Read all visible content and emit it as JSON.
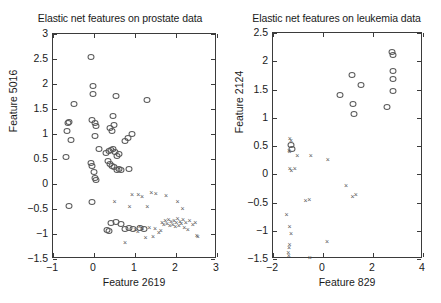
{
  "figure": {
    "background": "#ffffff",
    "marker_color": "#5a5a5a",
    "axis_color": "#3b3b3b"
  },
  "chart_data": [
    {
      "type": "scatter",
      "title": "Elastic net features on prostate data",
      "xlabel": "Feature 2619",
      "ylabel": "Feature 5016",
      "xlim": [
        -1,
        3
      ],
      "ylim": [
        -1.5,
        3
      ],
      "xticks": [
        -1,
        0,
        1,
        2,
        3
      ],
      "xticklabels": [
        "-1",
        "0",
        "1",
        "2",
        "3"
      ],
      "yticks": [
        -1.5,
        -1,
        -0.5,
        0,
        0.5,
        1,
        1.5,
        2,
        2.5,
        3
      ],
      "yticklabels": [
        "-1.5",
        "-1",
        "-0.5",
        "0",
        "0.5",
        "1",
        "1.5",
        "2",
        "2.5",
        "3"
      ],
      "grid": false,
      "legend": "none",
      "series": [
        {
          "name": "class-circle",
          "marker": "circle",
          "points": [
            [
              -0.08,
              2.55
            ],
            [
              -0.02,
              1.97
            ],
            [
              -0.03,
              1.81
            ],
            [
              -0.49,
              1.61
            ],
            [
              0.53,
              1.77
            ],
            [
              1.29,
              1.68
            ],
            [
              -0.64,
              1.22
            ],
            [
              -0.6,
              1.25
            ],
            [
              -0.66,
              1.06
            ],
            [
              -0.57,
              0.89
            ],
            [
              -0.06,
              1.29
            ],
            [
              0.02,
              1.22
            ],
            [
              0.06,
              1.17
            ],
            [
              0.46,
              1.36
            ],
            [
              0.4,
              1.13
            ],
            [
              0.44,
              1.06
            ],
            [
              0.49,
              1.18
            ],
            [
              0.93,
              1.01
            ],
            [
              -0.68,
              0.54
            ],
            [
              0.03,
              0.96
            ],
            [
              0.13,
              0.7
            ],
            [
              0.3,
              0.62
            ],
            [
              0.36,
              0.66
            ],
            [
              0.42,
              0.68
            ],
            [
              0.46,
              0.7
            ],
            [
              0.52,
              0.64
            ],
            [
              0.56,
              0.56
            ],
            [
              0.6,
              0.61
            ],
            [
              0.76,
              0.86
            ],
            [
              0.84,
              0.92
            ],
            [
              0.33,
              0.46
            ],
            [
              0.38,
              0.4
            ],
            [
              0.44,
              0.37
            ],
            [
              0.49,
              0.34
            ],
            [
              0.57,
              0.29
            ],
            [
              0.62,
              0.3
            ],
            [
              0.66,
              0.28
            ],
            [
              0.85,
              0.31
            ],
            [
              -0.07,
              0.43
            ],
            [
              -0.04,
              0.37
            ],
            [
              -0.01,
              0.24
            ],
            [
              0.02,
              0.13
            ],
            [
              0.04,
              0.09
            ],
            [
              -0.6,
              -0.44
            ],
            [
              -0.04,
              -0.35
            ],
            [
              0.31,
              -0.92
            ],
            [
              0.36,
              -0.93
            ],
            [
              0.41,
              -0.77
            ],
            [
              0.53,
              -0.76
            ],
            [
              0.65,
              -0.8
            ],
            [
              0.75,
              -0.9
            ],
            [
              0.86,
              -0.87
            ],
            [
              0.94,
              -0.89
            ],
            [
              1.13,
              -0.88
            ],
            [
              1.22,
              -0.9
            ]
          ]
        },
        {
          "name": "class-cross",
          "marker": "cross",
          "points": [
            [
              0.93,
              -0.22
            ],
            [
              1.08,
              -0.22
            ],
            [
              1.17,
              -0.25
            ],
            [
              1.4,
              -0.18
            ],
            [
              1.51,
              -0.19
            ],
            [
              1.76,
              -0.23
            ],
            [
              0.5,
              -0.35
            ],
            [
              0.87,
              -0.46
            ],
            [
              1.3,
              -0.45
            ],
            [
              2.04,
              -0.36
            ],
            [
              2.16,
              -0.5
            ],
            [
              0.76,
              -1.17
            ],
            [
              1.01,
              -0.91
            ],
            [
              1.07,
              -0.96
            ],
            [
              1.12,
              -0.86
            ],
            [
              1.18,
              -0.9
            ],
            [
              1.26,
              -1.07
            ],
            [
              1.35,
              -0.87
            ],
            [
              1.44,
              -1.06
            ],
            [
              1.49,
              -0.89
            ],
            [
              1.66,
              -0.78
            ],
            [
              1.7,
              -0.82
            ],
            [
              1.74,
              -0.74
            ],
            [
              1.78,
              -0.79
            ],
            [
              1.82,
              -0.71
            ],
            [
              1.85,
              -0.84
            ],
            [
              1.88,
              -0.76
            ],
            [
              1.92,
              -0.81
            ],
            [
              1.95,
              -0.73
            ],
            [
              1.98,
              -0.86
            ],
            [
              2.01,
              -0.78
            ],
            [
              2.04,
              -0.7
            ],
            [
              2.07,
              -0.83
            ],
            [
              2.1,
              -0.75
            ],
            [
              2.13,
              -0.8
            ],
            [
              2.17,
              -0.72
            ],
            [
              2.2,
              -0.88
            ],
            [
              2.24,
              -0.78
            ],
            [
              2.29,
              -0.92
            ],
            [
              2.33,
              -0.74
            ],
            [
              2.41,
              -0.81
            ],
            [
              2.47,
              -0.77
            ],
            [
              2.51,
              -1.04
            ],
            [
              2.53,
              -1.06
            ],
            [
              1.58,
              -0.97
            ],
            [
              1.63,
              -0.93
            ]
          ]
        }
      ]
    },
    {
      "type": "scatter",
      "title": "Elastic net features on leukemia data",
      "xlabel": "Feature 829",
      "ylabel": "Feature 2124",
      "xlim": [
        -2,
        4
      ],
      "ylim": [
        -1.5,
        2.5
      ],
      "xticks": [
        -2,
        0,
        2,
        4
      ],
      "xticklabels": [
        "-2",
        "0",
        "2",
        "4"
      ],
      "yticks": [
        -1.5,
        -1,
        -0.5,
        0,
        0.5,
        1,
        1.5,
        2,
        2.5
      ],
      "yticklabels": [
        "-1.5",
        "-1",
        "-0.5",
        "0",
        "0.5",
        "1",
        "1.5",
        "2",
        "2.5"
      ],
      "grid": false,
      "legend": "none",
      "series": [
        {
          "name": "class-circle",
          "marker": "circle",
          "points": [
            [
              2.77,
              2.17
            ],
            [
              2.79,
              2.11
            ],
            [
              2.78,
              1.83
            ],
            [
              2.78,
              1.69
            ],
            [
              2.78,
              1.47
            ],
            [
              2.55,
              1.19
            ],
            [
              1.14,
              1.76
            ],
            [
              1.53,
              1.58
            ],
            [
              1.19,
              1.24
            ],
            [
              1.25,
              1.06
            ],
            [
              0.66,
              1.4
            ],
            [
              -1.28,
              0.52
            ],
            [
              -1.26,
              0.45
            ]
          ]
        },
        {
          "name": "class-cross",
          "marker": "cross",
          "points": [
            [
              -1.33,
              0.62
            ],
            [
              -1.28,
              0.58
            ],
            [
              -1.36,
              0.41
            ],
            [
              -1.34,
              0.39
            ],
            [
              -1.03,
              0.33
            ],
            [
              -0.49,
              0.33
            ],
            [
              0.19,
              0.26
            ],
            [
              -1.33,
              0.09
            ],
            [
              -1.27,
              0.05
            ],
            [
              -1.13,
              0.1
            ],
            [
              0.92,
              -0.21
            ],
            [
              -0.7,
              -0.47
            ],
            [
              -0.55,
              -0.45
            ],
            [
              1.18,
              -0.4
            ],
            [
              1.31,
              -0.37
            ],
            [
              -1.46,
              -0.73
            ],
            [
              -1.34,
              -0.94
            ],
            [
              -1.28,
              -1.06
            ],
            [
              -1.34,
              -1.26
            ],
            [
              -1.36,
              -1.3
            ],
            [
              -1.39,
              -1.4
            ],
            [
              -1.37,
              -1.44
            ],
            [
              0.16,
              -1.2
            ],
            [
              -0.53,
              -1.49
            ]
          ]
        }
      ]
    }
  ]
}
